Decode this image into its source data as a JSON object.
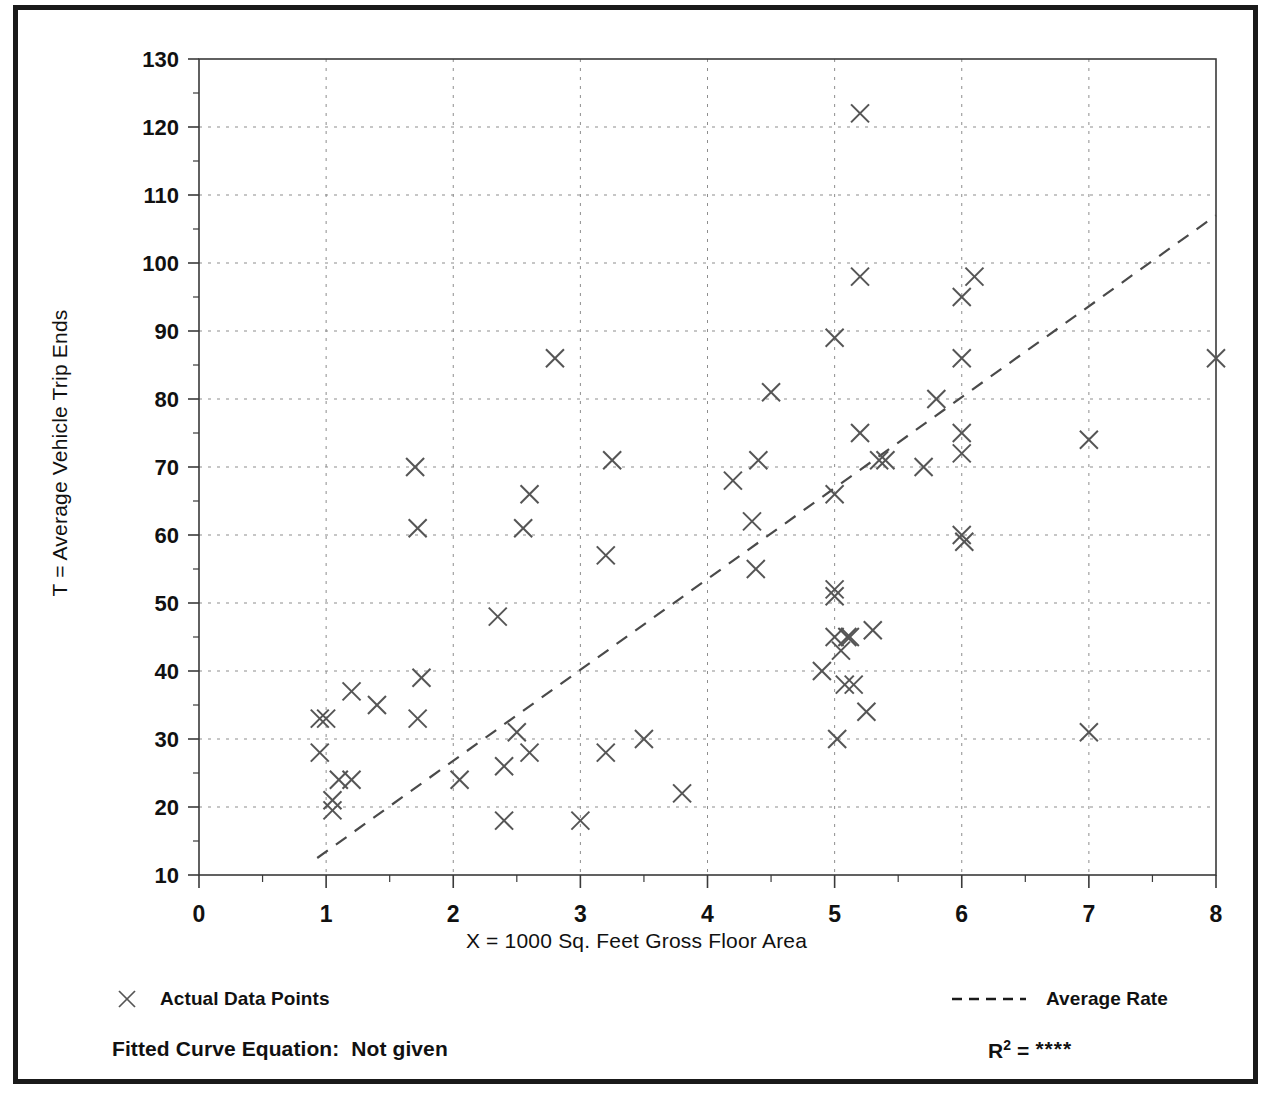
{
  "figure": {
    "frame_color": "#1a1a1a",
    "background": "#ffffff"
  },
  "axes": {
    "x_title": "X = 1000 Sq. Feet Gross Floor Area",
    "y_title": "T = Average Vehicle Trip Ends",
    "x_ticks": [
      "0",
      "1",
      "2",
      "3",
      "4",
      "5",
      "6",
      "7",
      "8"
    ],
    "y_ticks": [
      "130",
      "120",
      "110",
      "100",
      "90",
      "80",
      "70",
      "60",
      "50",
      "40",
      "30",
      "20",
      "10"
    ]
  },
  "legend": {
    "points_label": "Actual Data Points",
    "points_marker": "x-marker-icon",
    "line_label": "Average Rate",
    "line_marker": "dashed-line-icon"
  },
  "footer": {
    "fitted_curve_label": "Fitted Curve Equation:  Not given",
    "r_squared_prefix": "R",
    "r_squared_exponent": "2",
    "r_squared_equals": " = ",
    "r_squared_value": "****"
  },
  "chart_data": {
    "type": "scatter",
    "title": "",
    "xlabel": "X = 1000 Sq. Feet Gross Floor Area",
    "ylabel": "T = Average Vehicle Trip Ends",
    "xlim": [
      0,
      8
    ],
    "ylim": [
      10,
      130
    ],
    "x_major_step": 1,
    "x_minor_step": 0.5,
    "y_major_step": 10,
    "y_minor_step": 5,
    "grid": true,
    "grid_style": "dotted",
    "legend_position": "below-plot",
    "marker": "x",
    "marker_color": "#555555",
    "series": [
      {
        "name": "Actual Data Points",
        "type": "scatter",
        "points": [
          [
            0.95,
            33
          ],
          [
            1.0,
            33
          ],
          [
            0.95,
            28
          ],
          [
            1.05,
            21
          ],
          [
            1.05,
            19.5
          ],
          [
            1.1,
            24
          ],
          [
            1.2,
            24
          ],
          [
            1.2,
            37
          ],
          [
            1.4,
            35
          ],
          [
            1.7,
            70
          ],
          [
            1.72,
            61
          ],
          [
            1.75,
            39
          ],
          [
            1.72,
            33
          ],
          [
            2.05,
            24
          ],
          [
            2.35,
            48
          ],
          [
            2.4,
            26
          ],
          [
            2.4,
            18
          ],
          [
            2.5,
            31
          ],
          [
            2.55,
            61
          ],
          [
            2.6,
            66
          ],
          [
            2.6,
            28
          ],
          [
            2.8,
            86
          ],
          [
            3.0,
            18
          ],
          [
            3.2,
            28
          ],
          [
            3.2,
            57
          ],
          [
            3.25,
            71
          ],
          [
            3.5,
            30
          ],
          [
            3.8,
            22
          ],
          [
            4.2,
            68
          ],
          [
            4.35,
            62
          ],
          [
            4.38,
            55
          ],
          [
            4.4,
            71
          ],
          [
            4.5,
            81
          ],
          [
            4.9,
            40
          ],
          [
            5.0,
            66
          ],
          [
            5.0,
            89
          ],
          [
            5.0,
            52
          ],
          [
            5.0,
            51
          ],
          [
            5.0,
            45
          ],
          [
            5.02,
            30
          ],
          [
            5.05,
            43
          ],
          [
            5.08,
            38
          ],
          [
            5.1,
            45
          ],
          [
            5.12,
            45
          ],
          [
            5.15,
            38
          ],
          [
            5.2,
            122
          ],
          [
            5.2,
            98
          ],
          [
            5.2,
            75
          ],
          [
            5.25,
            34
          ],
          [
            5.3,
            46
          ],
          [
            5.35,
            71
          ],
          [
            5.4,
            71
          ],
          [
            5.7,
            70
          ],
          [
            5.8,
            80
          ],
          [
            6.0,
            95
          ],
          [
            6.0,
            86
          ],
          [
            6.0,
            75
          ],
          [
            6.0,
            72
          ],
          [
            6.0,
            60
          ],
          [
            6.02,
            59
          ],
          [
            6.1,
            98
          ],
          [
            7.0,
            74
          ],
          [
            7.0,
            31
          ],
          [
            8.0,
            86
          ]
        ]
      },
      {
        "name": "Average Rate",
        "type": "line",
        "style": "dashed",
        "endpoints": [
          [
            0.93,
            12.5
          ],
          [
            8.0,
            107
          ]
        ]
      }
    ]
  }
}
